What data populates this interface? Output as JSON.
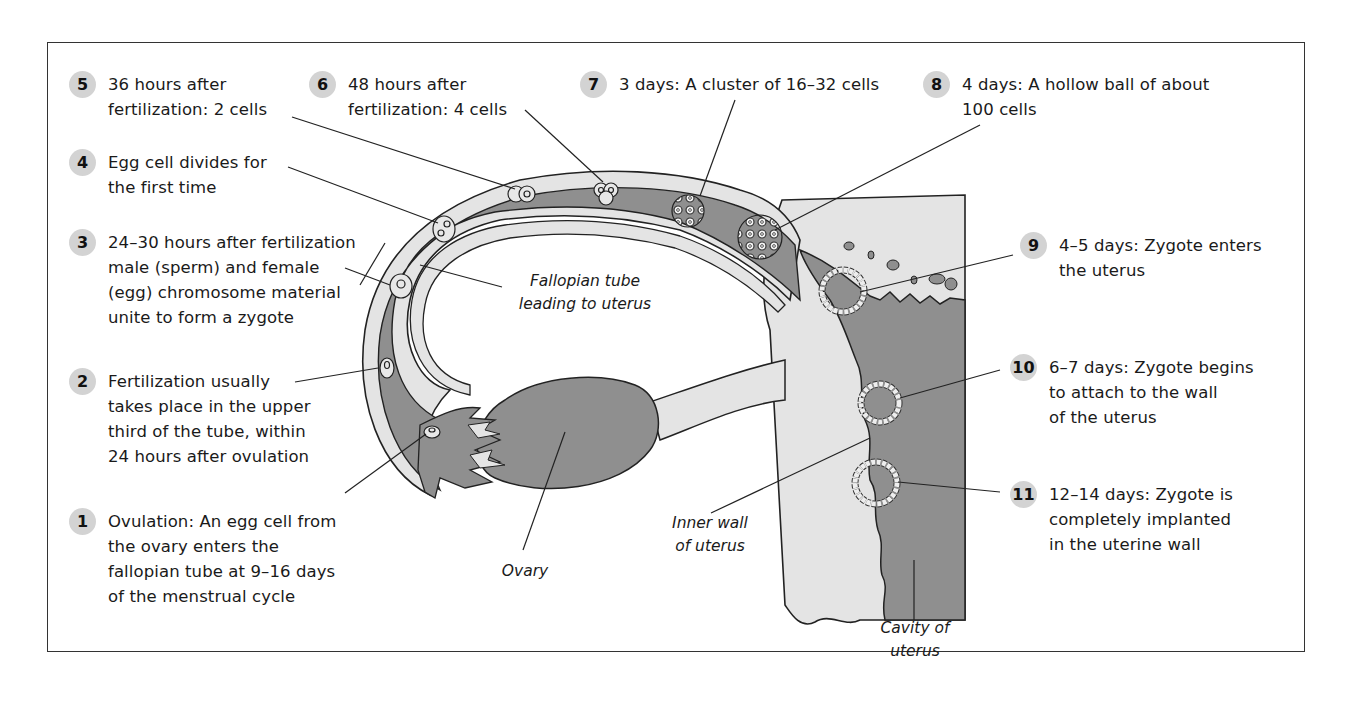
{
  "figure": {
    "title": "",
    "colors": {
      "tissue_dark": "#8f8f8f",
      "tissue_light": "#e4e4e4",
      "badge_bg": "#d3d3d3",
      "outline": "#222222",
      "frame": "#333333"
    }
  },
  "steps": [
    {
      "number": "1",
      "text": "Ovulation: An egg cell from\nthe ovary enters the\nfallopian tube at 9–16 days\nof the menstrual cycle"
    },
    {
      "number": "2",
      "text": "Fertilization usually\ntakes place in the upper\nthird of the tube, within\n24 hours after ovulation"
    },
    {
      "number": "3",
      "text": "24–30 hours after fertilization\nmale (sperm) and female\n(egg) chromosome material\nunite to form a zygote"
    },
    {
      "number": "4",
      "text": "Egg cell divides for\nthe first time"
    },
    {
      "number": "5",
      "text": "36 hours after\nfertilization: 2 cells"
    },
    {
      "number": "6",
      "text": "48 hours after\nfertilization: 4 cells"
    },
    {
      "number": "7",
      "text": "3 days: A cluster of 16–32 cells"
    },
    {
      "number": "8",
      "text": "4 days: A hollow ball of about\n100 cells"
    },
    {
      "number": "9",
      "text": "4–5 days: Zygote enters\nthe uterus"
    },
    {
      "number": "10",
      "text": "6–7 days: Zygote begins\nto attach to the wall\nof the uterus"
    },
    {
      "number": "11",
      "text": "12–14 days: Zygote is\ncompletely implanted\nin the uterine wall"
    }
  ],
  "anatomy_labels": {
    "fallopian_tube": "Fallopian tube\nleading to uterus",
    "ovary": "Ovary",
    "inner_wall": "Inner wall\nof uterus",
    "cavity": "Cavity of\nuterus"
  }
}
